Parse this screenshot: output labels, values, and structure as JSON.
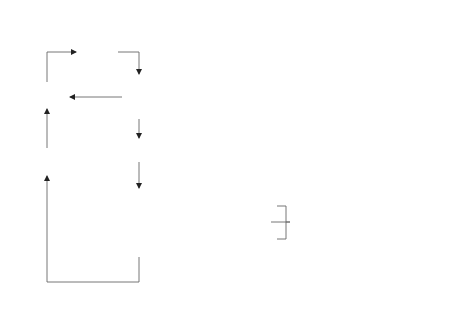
{
  "diagram": {
    "type": "flowchart",
    "left_loop": {
      "implement_corrective_measures": {
        "label": "Implement corrective measures",
        "marker": "4"
      },
      "corrective_measures": {
        "label": "Corrective measures",
        "marker": "3"
      },
      "impact_assessment": {
        "label": "Impact assessment",
        "marker": "5"
      },
      "product_innovation": {
        "label": "Product innovation",
        "marker": "6"
      },
      "failure_analysis": {
        "label": "Failure analysis",
        "marker": "2"
      },
      "start_marker": "1",
      "useless_label": "Useless",
      "usefulness_label": "Usefulness",
      "curve_label": "Early failure passive elimination"
    },
    "failure_collection": {
      "marker": "1",
      "left_cell": "The failure of the same product occurred at the early stage of its use",
      "middle_cell": "Failure collection",
      "right_top_cell": "Failure in the manufacturing process",
      "right_bottom_cell": "Failure occurred during the use of similar products"
    },
    "right_loop": {
      "statistical_analysis": {
        "label": "Statistical analysis of failure",
        "marker": "2"
      },
      "selection_model": {
        "label": "Selection of early failure model",
        "marker": "3"
      },
      "calculation_period": {
        "label": "Calculation of the early fault period",
        "marker": "4"
      },
      "analysis_early_failure": {
        "label": "Analysis of early failure",
        "marker": "5"
      },
      "formulation": {
        "label": "Formulation of corrective measures",
        "marker": "6"
      },
      "analysis_test": {
        "label": "Analysis test",
        "marker": "7"
      },
      "effective_or_not": {
        "label": "Effective or not",
        "marker": "8"
      },
      "product_innovation": {
        "label": "Product innovation",
        "marker": "9"
      },
      "invalid_label": "Invalid",
      "effective_label": "Effective",
      "curve_label": "Early failure active elimination"
    },
    "colors": {
      "line": "#555555",
      "text": "#3a3a3a",
      "background": "#ffffff"
    }
  }
}
